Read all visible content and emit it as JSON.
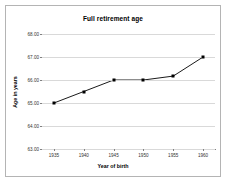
{
  "chart_data": {
    "type": "line",
    "title": "Full retirement age",
    "xlabel": "Year of birth",
    "ylabel": "Age in years",
    "categories": [
      1935,
      1940,
      1945,
      1950,
      1955,
      1960
    ],
    "x_tick_labels": [
      "1935",
      "1940",
      "1945",
      "1950",
      "1955",
      "1960"
    ],
    "values": [
      65.0,
      65.5,
      66.0,
      66.0,
      66.17,
      67.0
    ],
    "y_tick_labels": [
      "68.00",
      "67.00",
      "66.00",
      "65.00",
      "64.00",
      "63.00"
    ],
    "y_ticks": [
      68,
      67,
      66,
      65,
      64,
      63
    ],
    "ylim": [
      63,
      68
    ],
    "xlim": [
      1933,
      1962
    ],
    "grid": "horizontal",
    "legend": "none",
    "series_color": "#000000",
    "marker": "square",
    "gridline_color": "#d9d9d9",
    "axis_color": "#808080",
    "plot_background": "#ffffff",
    "border_color": "#b4b4b4"
  }
}
